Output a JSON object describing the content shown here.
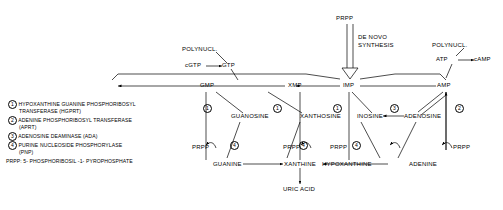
{
  "legend": {
    "entries": [
      {
        "num": "1",
        "lines": [
          "HYPOXANTHINE  GUANINE  PHOSPHORIBOSYL",
          "TRANSFERASE (HGPRT)"
        ]
      },
      {
        "num": "2",
        "lines": [
          "ADENINE PHOSPHORIBOSYL TRANSFERASE",
          "(APRT)"
        ]
      },
      {
        "num": "3",
        "lines": [
          "ADENOSINE  DEAMINASE (ADA)"
        ]
      },
      {
        "num": "4",
        "lines": [
          "PURINE NUCLEOSIDE PHOSPHORYLASE",
          "(PNP)"
        ]
      }
    ],
    "footnote": "PRPP: 5- PHOSPHORIBOSIL -1- PYROPHOSPHATE"
  },
  "diagram": {
    "top": {
      "prpp": "PRPP",
      "de_novo_line1": "DE NOVO",
      "de_novo_line2": "SYNTHESIS",
      "polynucl_left": "POLYNUCL.",
      "polynucl_right": "POLYNUCL.",
      "cgtp": "cGTP",
      "gtp": "GTP",
      "atp": "ATP",
      "camp": "cAMP"
    },
    "nucleotides": [
      "GMP",
      "XMP",
      "IMP",
      "AMP"
    ],
    "nucleosides": [
      "GUANOSINE",
      "XANTHOSINE",
      "INOSINE",
      "ADENOSINE"
    ],
    "bases": [
      "GUANINE",
      "XANTHINE",
      "HYPOXANTHINE",
      "ADENINE"
    ],
    "uric_acid": "URIC ACID",
    "prpp_labels": [
      "PRPP",
      "PRPP",
      "PRPP",
      "PRPP"
    ],
    "enzyme_marks": {
      "salvage_nucleotide": [
        "1",
        "1",
        "1",
        "2"
      ],
      "pnp": [
        "4",
        "4",
        "4"
      ],
      "ada": "3"
    }
  }
}
